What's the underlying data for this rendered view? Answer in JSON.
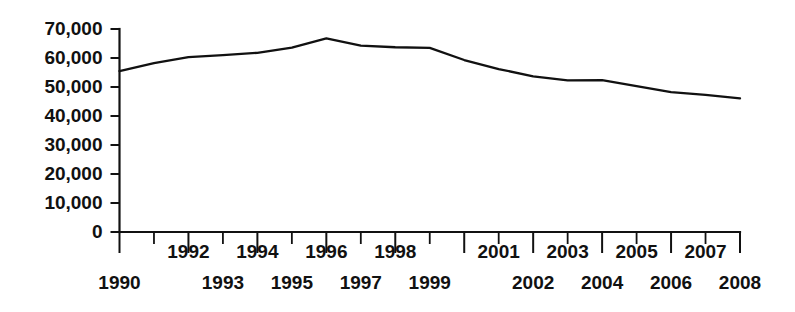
{
  "chart_data": {
    "type": "line",
    "title": "",
    "subtitle": "",
    "xlabel": "",
    "ylabel": "",
    "grid": false,
    "legend": false,
    "legend_position": "none",
    "line_color": "#111111",
    "x": [
      1990,
      1991,
      1992,
      1993,
      1994,
      1995,
      1996,
      1997,
      1998,
      1999,
      2000,
      2001,
      2002,
      2003,
      2004,
      2005,
      2006,
      2007,
      2008
    ],
    "values": [
      55500,
      58200,
      60300,
      61000,
      61800,
      63600,
      66800,
      64300,
      63700,
      63500,
      59300,
      56200,
      53700,
      52300,
      52400,
      50300,
      48200,
      47300,
      46100
    ],
    "xtick_labels_upper": [
      "1992",
      "1994",
      "1996",
      "1998",
      "2001",
      "2003",
      "2005",
      "2007"
    ],
    "xtick_labels_lower": [
      "1990",
      "1993",
      "1995",
      "1997",
      "1999",
      "2002",
      "2004",
      "2006",
      "2008"
    ],
    "ytick_labels": [
      "70,000",
      "60,000",
      "50,000",
      "40,000",
      "30,000",
      "20,000",
      "10,000",
      "0"
    ],
    "ytick_values": [
      70000,
      60000,
      50000,
      40000,
      30000,
      20000,
      10000,
      0
    ],
    "xlim": [
      1990,
      2008
    ],
    "ylim": [
      0,
      70000
    ]
  }
}
